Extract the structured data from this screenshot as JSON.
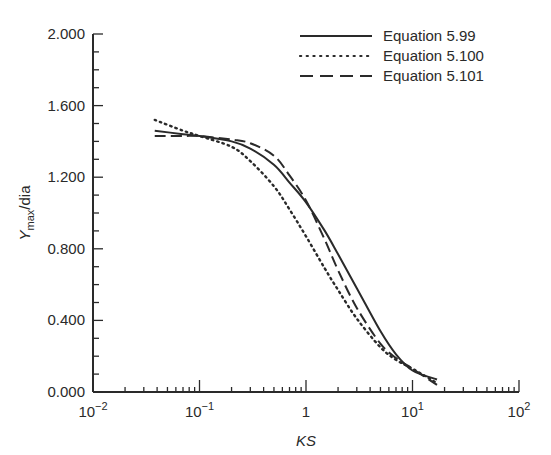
{
  "chart_data": {
    "type": "line",
    "title": "",
    "xlabel": "KS",
    "ylabel": "Y_max/dia",
    "xscale": "log",
    "xlim": [
      0.01,
      100
    ],
    "ylim": [
      0.0,
      2.0
    ],
    "grid": false,
    "legend_position": "upper right",
    "x_tick_labels": [
      "10^-2",
      "10^-1",
      "1",
      "10^1",
      "10^2"
    ],
    "y_tick_labels": [
      "0.000",
      "0.400",
      "0.800",
      "1.200",
      "1.600",
      "2.000"
    ],
    "series": [
      {
        "name": "Equation 5.99",
        "style": "solid",
        "x": [
          0.038,
          0.07,
          0.1,
          0.2,
          0.3,
          0.5,
          0.7,
          1.0,
          1.5,
          2.0,
          3.0,
          5.0,
          7.0,
          10.0,
          17.0
        ],
        "y": [
          1.46,
          1.44,
          1.43,
          1.4,
          1.36,
          1.27,
          1.17,
          1.06,
          0.9,
          0.77,
          0.58,
          0.34,
          0.21,
          0.12,
          0.07
        ]
      },
      {
        "name": "Equation 5.100",
        "style": "dotted",
        "x": [
          0.038,
          0.07,
          0.1,
          0.2,
          0.3,
          0.5,
          0.7,
          1.0,
          1.5,
          2.0,
          3.0,
          5.0,
          7.0,
          10.0,
          17.0
        ],
        "y": [
          1.52,
          1.46,
          1.43,
          1.37,
          1.29,
          1.15,
          1.02,
          0.87,
          0.69,
          0.57,
          0.41,
          0.25,
          0.18,
          0.13,
          0.05
        ]
      },
      {
        "name": "Equation 5.101",
        "style": "dashed",
        "x": [
          0.038,
          0.07,
          0.1,
          0.2,
          0.3,
          0.5,
          0.7,
          1.0,
          1.5,
          2.0,
          3.0,
          5.0,
          7.0,
          10.0,
          17.0
        ],
        "y": [
          1.43,
          1.43,
          1.43,
          1.41,
          1.39,
          1.32,
          1.21,
          1.07,
          0.85,
          0.68,
          0.47,
          0.27,
          0.19,
          0.13,
          0.04
        ]
      }
    ]
  },
  "axes": {
    "xlabel": "KS",
    "ylabel_main": "Y",
    "ylabel_sub": "max",
    "ylabel_rest": "/dia",
    "y_ticks": [
      "0.000",
      "0.400",
      "0.800",
      "1.200",
      "1.600",
      "2.000"
    ],
    "x_ticks": [
      {
        "base": "10",
        "exp": "−2"
      },
      {
        "base": "10",
        "exp": "−1"
      },
      {
        "base": "1",
        "exp": ""
      },
      {
        "base": "10",
        "exp": "1"
      },
      {
        "base": "10",
        "exp": "2"
      }
    ]
  },
  "legend": {
    "items": [
      "Equation 5.99",
      "Equation 5.100",
      "Equation 5.101"
    ]
  },
  "colors": {
    "ink": "#2a2a2a",
    "background": "#ffffff"
  }
}
